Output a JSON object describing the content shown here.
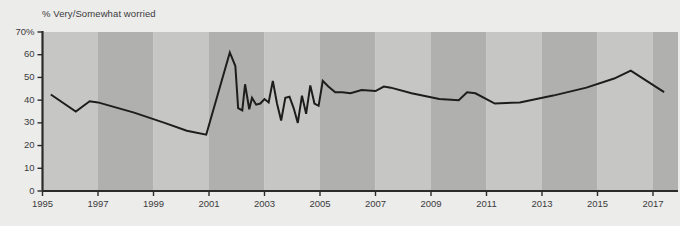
{
  "chart_data": {
    "type": "line",
    "title": "% Very/Somewhat worried",
    "xlabel": "",
    "ylabel": "",
    "ylim": [
      0,
      70
    ],
    "xlim": [
      1995,
      2017.8
    ],
    "grid": false,
    "legend": null,
    "y_ticks": [
      0,
      10,
      20,
      30,
      40,
      50,
      60,
      70
    ],
    "y_tick_labels": [
      "0",
      "10",
      "20",
      "30",
      "40",
      "50",
      "60",
      "70%"
    ],
    "x_ticks": [
      1995,
      1997,
      1999,
      2001,
      2003,
      2005,
      2007,
      2009,
      2011,
      2013,
      2015,
      2017
    ],
    "x_tick_labels": [
      "1995",
      "1997",
      "1999",
      "2001",
      "2003",
      "2005",
      "2007",
      "2009",
      "2011",
      "2013",
      "2015",
      "2017"
    ],
    "background_bands": {
      "light_color": "#c6c6c4",
      "dark_color": "#b0b0ae",
      "band_years": 2,
      "start_year": 1995
    },
    "line_color": "#1d1d1d",
    "series": [
      {
        "name": "% Very/Somewhat worried",
        "x": [
          1995.3,
          1996.2,
          1996.7,
          1997.0,
          1998.3,
          1999.4,
          2000.2,
          2000.9,
          2001.75,
          2001.95,
          2002.05,
          2002.2,
          2002.3,
          2002.45,
          2002.55,
          2002.7,
          2002.85,
          2003.0,
          2003.15,
          2003.3,
          2003.45,
          2003.6,
          2003.75,
          2003.9,
          2004.05,
          2004.2,
          2004.35,
          2004.5,
          2004.65,
          2004.8,
          2004.95,
          2005.1,
          2005.3,
          2005.55,
          2005.8,
          2006.1,
          2006.5,
          2007.0,
          2007.3,
          2007.55,
          2008.3,
          2009.3,
          2010.0,
          2010.3,
          2010.6,
          2011.3,
          2012.2,
          2013.4,
          2014.6,
          2015.6,
          2016.2,
          2017.4
        ],
        "y": [
          42.5,
          35.0,
          39.5,
          39.0,
          34.5,
          30.0,
          26.5,
          24.8,
          61.0,
          55.0,
          36.5,
          35.5,
          47.0,
          36.0,
          41.0,
          38.0,
          38.5,
          40.5,
          39.0,
          48.5,
          38.5,
          31.0,
          41.0,
          41.5,
          36.5,
          30.0,
          42.0,
          34.0,
          46.5,
          38.5,
          37.5,
          48.5,
          46.0,
          43.5,
          43.5,
          43.0,
          44.5,
          44.0,
          46.0,
          45.5,
          43.0,
          40.5,
          40.0,
          43.5,
          43.0,
          38.5,
          39.0,
          42.0,
          45.5,
          49.5,
          53.0,
          43.5
        ]
      }
    ],
    "annotations": []
  },
  "axes": {
    "y_axis_name": "percent-axis",
    "x_axis_name": "year-axis"
  }
}
